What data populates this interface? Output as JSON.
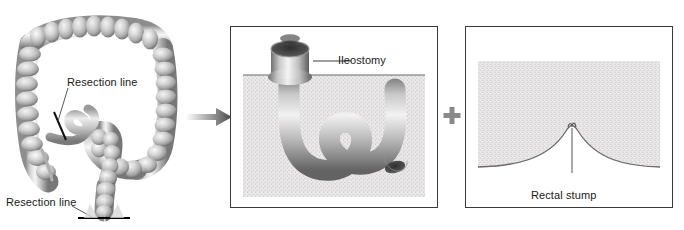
{
  "figure": {
    "background_color": "#ffffff",
    "line_color": "#3a3a3a",
    "text_color": "#1a1a1a",
    "tissue_fill": "#e8e8e8",
    "bowel_light": "#f2f2f2",
    "bowel_mid": "#b9b9b9",
    "bowel_dark": "#6e6e6e"
  },
  "panels": {
    "anatomy": {
      "name": "colon anatomy with resection lines",
      "labels": {
        "resection_line_upper": "Resection line",
        "resection_line_lower": "Resection line"
      }
    },
    "stoma": {
      "name": "ileostomy panel",
      "labels": {
        "ileostomy": "Ileostomy"
      }
    },
    "stump": {
      "name": "rectal stump panel",
      "labels": {
        "rectal_stump": "Rectal stump"
      }
    }
  },
  "connectors": {
    "arrow": "arrow-right",
    "plus": "+"
  }
}
